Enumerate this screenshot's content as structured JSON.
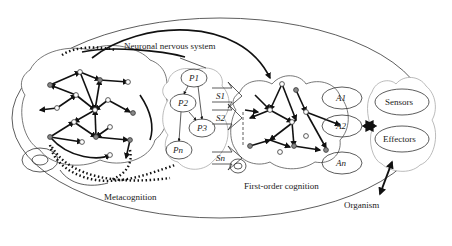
{
  "diagram": {
    "title_labels": {
      "neuronal_nervous_system": "Neuronal nervous system",
      "metacognition": "Metacognition",
      "first_order_cognition": "First-order cognition",
      "organism": "Organism"
    },
    "processes": [
      "P1",
      "P2",
      "P3",
      "Pn"
    ],
    "signals": [
      "S1",
      "S2",
      "Sn"
    ],
    "actions": [
      "A1",
      "A2",
      "An"
    ],
    "interface": {
      "sensors": "Sensors",
      "effectors": "Effectors"
    },
    "colors": {
      "stroke": "#111111",
      "node_filled": "#888888",
      "node_empty": "#ffffff",
      "background": "#ffffff"
    }
  }
}
